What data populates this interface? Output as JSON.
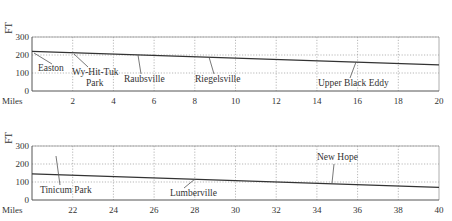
{
  "chart_data": [
    {
      "type": "line",
      "title": "",
      "xlabel": "Miles",
      "ylabel": "FT",
      "xlim": [
        0,
        20
      ],
      "ylim": [
        0,
        300
      ],
      "grid": true,
      "x_ticks": [
        2,
        4,
        6,
        8,
        10,
        12,
        14,
        16,
        18,
        20
      ],
      "y_ticks": [
        0,
        100,
        200,
        300
      ],
      "series": [
        {
          "name": "River elevation profile",
          "x": [
            0,
            20
          ],
          "y": [
            220,
            145
          ]
        }
      ],
      "annotations": [
        {
          "label": "Easton",
          "x": 0,
          "label_lines": [
            "Easton"
          ]
        },
        {
          "label": "Wy-Hit-Tuk Park",
          "x": 2,
          "label_lines": [
            "Wy-Hit-Tuk",
            "Park"
          ]
        },
        {
          "label": "Raubsville",
          "x": 5.3,
          "label_lines": [
            "Raubsville"
          ]
        },
        {
          "label": "Riegelsville",
          "x": 8.7,
          "label_lines": [
            "Riegelsville"
          ]
        },
        {
          "label": "Upper Black Eddy",
          "x": 15.9,
          "label_lines": [
            "Upper Black Eddy"
          ]
        }
      ]
    },
    {
      "type": "line",
      "title": "",
      "xlabel": "Miles",
      "ylabel": "FT",
      "xlim": [
        20,
        40
      ],
      "ylim": [
        0,
        300
      ],
      "grid": true,
      "x_ticks": [
        22,
        24,
        26,
        28,
        30,
        32,
        34,
        36,
        38,
        40
      ],
      "y_ticks": [
        0,
        100,
        200,
        300
      ],
      "series": [
        {
          "name": "River elevation profile",
          "x": [
            20,
            40
          ],
          "y": [
            145,
            70
          ]
        }
      ],
      "annotations": [
        {
          "label": "Tinicum Park",
          "x": 21.2,
          "label_lines": [
            "Tinicum Park"
          ]
        },
        {
          "label": "Lumberville",
          "x": 28.1,
          "label_lines": [
            "Lumberville"
          ]
        },
        {
          "label": "New Hope",
          "x": 34.8,
          "label_lines": [
            "New Hope"
          ]
        }
      ]
    }
  ],
  "colors": {
    "line": "#333333",
    "grid": "#9a9a9a",
    "text": "#333333"
  }
}
